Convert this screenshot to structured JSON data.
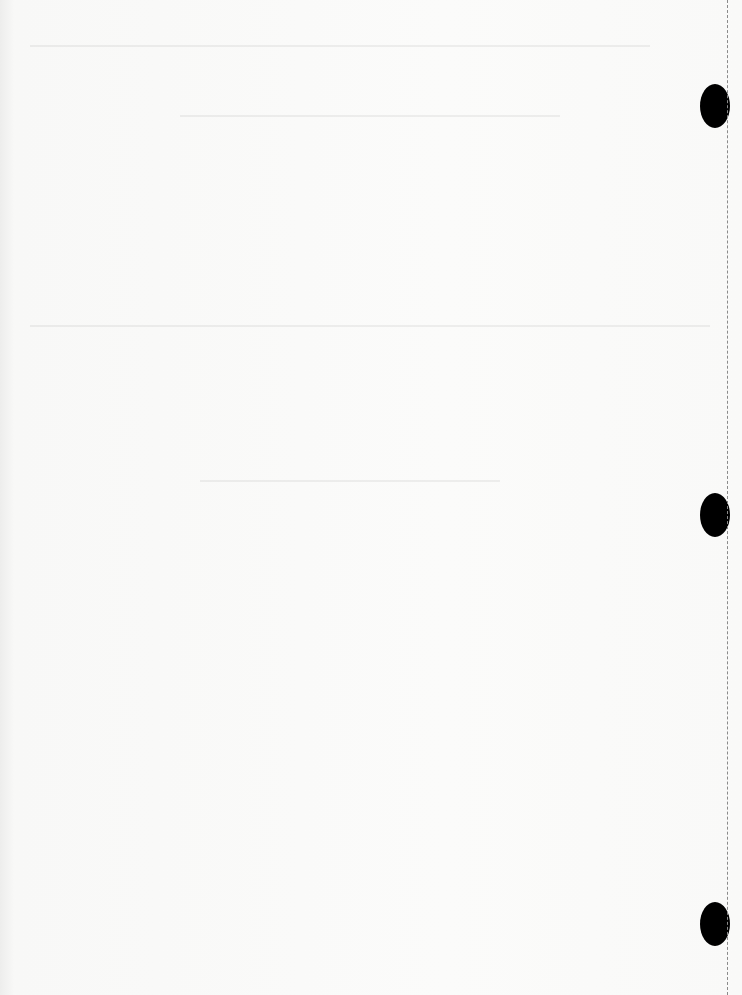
{
  "document": {
    "type": "blank scanned page",
    "visible_text": "",
    "punch_holes": [
      {
        "x": 715,
        "y": 106
      },
      {
        "x": 715,
        "y": 515
      },
      {
        "x": 715,
        "y": 924
      }
    ],
    "colors": {
      "paper": "#f9f9f8",
      "hole": "#000000",
      "perforation": "#8a8a8a"
    }
  }
}
